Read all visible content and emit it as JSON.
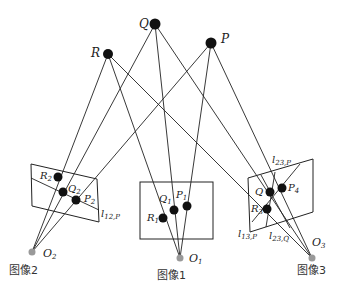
{
  "diagram": {
    "type": "multi-view epipolar geometry",
    "world_points": [
      {
        "id": "Q",
        "label": "Q",
        "x": 155,
        "y": 24
      },
      {
        "id": "P",
        "label": "P",
        "x": 211,
        "y": 43
      },
      {
        "id": "R",
        "label": "R",
        "x": 108,
        "y": 54
      }
    ],
    "cameras": [
      {
        "id": "O2",
        "label": "O",
        "sub": "2",
        "x": 32,
        "y": 252,
        "caption": "图像2"
      },
      {
        "id": "O1",
        "label": "O",
        "sub": "1",
        "x": 180,
        "y": 258,
        "caption": "图像1"
      },
      {
        "id": "O3",
        "label": "O",
        "sub": "3",
        "x": 312,
        "y": 258,
        "caption": "图像3"
      }
    ],
    "image_points": [
      {
        "label": "R",
        "sub": "2",
        "x": 58,
        "y": 177
      },
      {
        "label": "Q",
        "sub": "2",
        "x": 63,
        "y": 192
      },
      {
        "label": "P",
        "sub": "2",
        "x": 76,
        "y": 200
      },
      {
        "label": "R",
        "sub": "1",
        "x": 163,
        "y": 218
      },
      {
        "label": "Q",
        "sub": "1",
        "x": 174,
        "y": 210
      },
      {
        "label": "P",
        "sub": "1",
        "x": 187,
        "y": 206
      },
      {
        "label": "Q",
        "sub": "",
        "x": 270,
        "y": 192
      },
      {
        "label": "P",
        "sub": "4",
        "x": 282,
        "y": 188
      },
      {
        "label": "R",
        "sub": "3",
        "x": 267,
        "y": 209
      }
    ],
    "epipolar_lines": [
      {
        "label": "l",
        "sub": "12,P"
      },
      {
        "label": "l",
        "sub": "23,P"
      },
      {
        "label": "l",
        "sub": "13,P"
      },
      {
        "label": "l",
        "sub": "23,Q"
      }
    ],
    "captions": {
      "image1": "图像1",
      "image2": "图像2",
      "image3": "图像3"
    }
  }
}
